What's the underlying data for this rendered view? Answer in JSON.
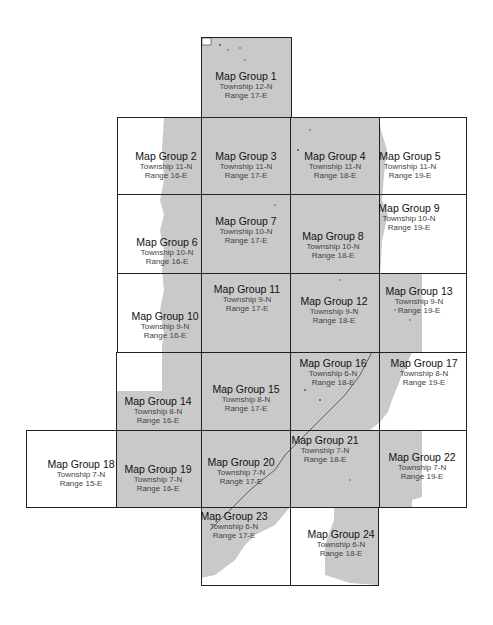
{
  "map": {
    "land_color": "#c9c9c9",
    "water_color": "#ffffff",
    "border_color": "#222222",
    "groups": [
      {
        "id": 1,
        "title": "Map Group 1",
        "township": "Township 12-N",
        "range": "Range 17-E"
      },
      {
        "id": 2,
        "title": "Map Group 2",
        "township": "Township 11-N",
        "range": "Range 16-E"
      },
      {
        "id": 3,
        "title": "Map Group 3",
        "township": "Township 11-N",
        "range": "Range 17-E"
      },
      {
        "id": 4,
        "title": "Map Group 4",
        "township": "Township 11-N",
        "range": "Range 18-E"
      },
      {
        "id": 5,
        "title": "Map Group 5",
        "township": "Township 11-N",
        "range": "Range 19-E"
      },
      {
        "id": 6,
        "title": "Map Group 6",
        "township": "Township 10-N",
        "range": "Range 16-E"
      },
      {
        "id": 7,
        "title": "Map Group 7",
        "township": "Township 10-N",
        "range": "Range 17-E"
      },
      {
        "id": 8,
        "title": "Map Group 8",
        "township": "Township 10-N",
        "range": "Range 18-E"
      },
      {
        "id": 9,
        "title": "Map Group 9",
        "township": "Township 10-N",
        "range": "Range 19-E"
      },
      {
        "id": 10,
        "title": "Map Group 10",
        "township": "Township 9-N",
        "range": "Range 16-E"
      },
      {
        "id": 11,
        "title": "Map Group 11",
        "township": "Township 9-N",
        "range": "Range 17-E"
      },
      {
        "id": 12,
        "title": "Map Group 12",
        "township": "Township 9-N",
        "range": "Range 18-E"
      },
      {
        "id": 13,
        "title": "Map Group 13",
        "township": "Township 9-N",
        "range": "Range 19-E"
      },
      {
        "id": 14,
        "title": "Map Group 14",
        "township": "Township 8-N",
        "range": "Range 16-E"
      },
      {
        "id": 15,
        "title": "Map Group 15",
        "township": "Township 8-N",
        "range": "Range 17-E"
      },
      {
        "id": 16,
        "title": "Map Group 16",
        "township": "Township 6-N",
        "range": "Range 18-E"
      },
      {
        "id": 17,
        "title": "Map Group 17",
        "township": "Township 8-N",
        "range": "Range 19-E"
      },
      {
        "id": 18,
        "title": "Map Group 18",
        "township": "Township 7-N",
        "range": "Range 15-E"
      },
      {
        "id": 19,
        "title": "Map Group 19",
        "township": "Township 7-N",
        "range": "Range 16-E"
      },
      {
        "id": 20,
        "title": "Map Group 20",
        "township": "Township 7-N",
        "range": "Range 17-E"
      },
      {
        "id": 21,
        "title": "Map Group 21",
        "township": "Township 7-N",
        "range": "Range 18-E"
      },
      {
        "id": 22,
        "title": "Map Group 22",
        "township": "Township 7-N",
        "range": "Range 19-E"
      },
      {
        "id": 23,
        "title": "Map Group 23",
        "township": "Township 6-N",
        "range": "Range 17-E"
      },
      {
        "id": 24,
        "title": "Map Group 24",
        "township": "Township 6-N",
        "range": "Range 18-E"
      }
    ]
  }
}
